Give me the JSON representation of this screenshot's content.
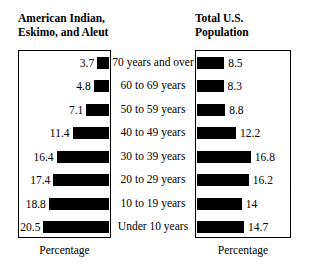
{
  "panels": {
    "left": {
      "title": "American Indian,\nEskimo, and Aleut",
      "axis_caption": "Percentage"
    },
    "right": {
      "title": "Total U.S.\nPopulation",
      "axis_caption": "Percentage"
    }
  },
  "chart_data": {
    "type": "bar",
    "orientation": "horizontal",
    "layout": "back-to-back paired horizontal bar chart (population pyramid style)",
    "title": "",
    "categories": [
      "70 years and over",
      "60 to 69 years",
      "50 to 59 years",
      "40 to 49 years",
      "30 to 39 years",
      "20 to 29 years",
      "10 to 19 years",
      "Under 10 years"
    ],
    "xlabel": "Percentage",
    "ylabel": "",
    "xlim": [
      0,
      22
    ],
    "grid": false,
    "legend": false,
    "bar_color": "#000000",
    "series": [
      {
        "name": "American Indian, Eskimo, and Aleut",
        "side": "left",
        "direction": "right-to-left",
        "values": [
          3.7,
          4.8,
          7.1,
          11.4,
          16.4,
          17.4,
          18.8,
          20.5
        ],
        "labels": [
          "3.7",
          "4.8",
          "7.1",
          "11.4",
          "16.4",
          "17.4",
          "18.8",
          "20.5"
        ]
      },
      {
        "name": "Total U.S. Population",
        "side": "right",
        "direction": "left-to-right",
        "values": [
          8.5,
          8.3,
          8.8,
          12.2,
          16.8,
          16.2,
          14,
          14.7
        ],
        "labels": [
          "8.5",
          "8.3",
          "8.8",
          "12.2",
          "16.8",
          "16.2",
          "14",
          "14.7"
        ]
      }
    ]
  }
}
